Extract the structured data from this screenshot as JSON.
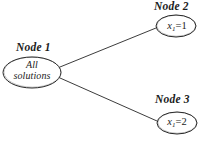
{
  "diagram": {
    "background_color": "#ffffff",
    "stroke_color": "#1c1c1c",
    "nodes": [
      {
        "id": "node1",
        "caption": "Node 1",
        "text_line1": "All",
        "text_line2": "solutions",
        "shape": "ellipse",
        "cx": 32,
        "cy": 72,
        "rx": 29,
        "ry": 15
      },
      {
        "id": "node2",
        "caption": "Node 2",
        "variable": "x",
        "subscript": "1",
        "operator": "=",
        "value": "1",
        "shape": "ellipse",
        "cx": 176,
        "cy": 26,
        "rx": 20,
        "ry": 11
      },
      {
        "id": "node3",
        "caption": "Node 3",
        "variable": "x",
        "subscript": "1",
        "operator": "=",
        "value": "2",
        "shape": "ellipse",
        "cx": 177,
        "cy": 123,
        "rx": 20,
        "ry": 11
      }
    ],
    "edges": [
      {
        "id": "edge-1-2",
        "from": "node1",
        "to": "node2",
        "x1": 60,
        "y1": 67,
        "x2": 156,
        "y2": 28
      },
      {
        "id": "edge-1-3",
        "from": "node1",
        "to": "node3",
        "x1": 60,
        "y1": 78,
        "x2": 157,
        "y2": 121
      }
    ]
  }
}
